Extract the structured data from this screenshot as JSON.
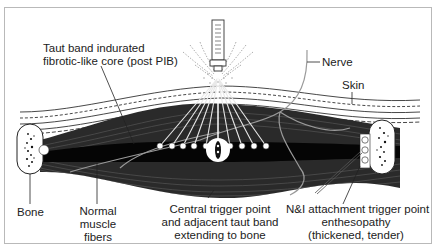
{
  "figure": {
    "labels": {
      "taut_band_line1": "Taut band indurated",
      "taut_band_line2": "fibrotic-like core (post PIB)",
      "nerve": "Nerve",
      "skin": "Skin",
      "bone": "Bone",
      "normal_muscle_line1": "Normal",
      "normal_muscle_line2": "muscle",
      "normal_muscle_line3": "fibers",
      "central_tp_line1": "Central trigger point",
      "central_tp_line2": "and adjacent taut band",
      "central_tp_line3": "extending to bone",
      "attachment_tp_line1": "N&I attachment trigger point",
      "attachment_tp_line2": "enthesopathy",
      "attachment_tp_line3": "(thickened, tender)"
    },
    "colors": {
      "muscle": "#2a2a2a",
      "taut_band": "#050505",
      "fiber_line": "#6a6a6a",
      "nerve": "#9a9a9a",
      "outline": "#222222",
      "frame": "#b9b9b9"
    },
    "needle_targets_count": 9
  }
}
